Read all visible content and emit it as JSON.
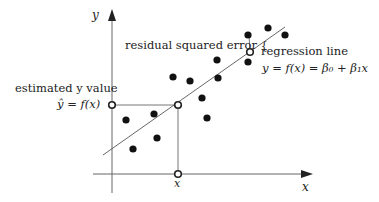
{
  "diagram": {
    "type": "linear regression illustration",
    "axes": {
      "x_label": "x",
      "y_label": "y",
      "x_axis": {
        "x1": 93,
        "x2": 312,
        "y": 174
      },
      "y_axis": {
        "x": 112,
        "y1": 193,
        "y2": 10
      }
    },
    "regression_line": {
      "x1": 103,
      "y1": 155,
      "x2": 285,
      "y2": 27,
      "color": "#555555"
    },
    "points": [
      {
        "x": 126,
        "y": 120
      },
      {
        "x": 133,
        "y": 149
      },
      {
        "x": 154,
        "y": 114
      },
      {
        "x": 157,
        "y": 138
      },
      {
        "x": 173,
        "y": 77
      },
      {
        "x": 190,
        "y": 81
      },
      {
        "x": 202,
        "y": 98
      },
      {
        "x": 207,
        "y": 118
      },
      {
        "x": 217,
        "y": 60
      },
      {
        "x": 218,
        "y": 78
      },
      {
        "x": 248,
        "y": 35
      },
      {
        "x": 248,
        "y": 62
      },
      {
        "x": 268,
        "y": 28
      },
      {
        "x": 285,
        "y": 35
      }
    ],
    "point_color": "#111111",
    "hollow_points": [
      {
        "name": "estimated-y-marker",
        "x": 112,
        "y": 105
      },
      {
        "name": "prediction-point",
        "x": 178,
        "y": 105
      },
      {
        "name": "x-value-marker",
        "x": 178,
        "y": 174
      },
      {
        "name": "line-point-at-residual",
        "x": 250,
        "y": 52
      }
    ],
    "guide_lines": [
      {
        "x1": 112,
        "y1": 105,
        "x2": 178,
        "y2": 105
      },
      {
        "x1": 178,
        "y1": 105,
        "x2": 178,
        "y2": 174
      },
      {
        "x1": 248,
        "y1": 35,
        "x2": 250,
        "y2": 52
      }
    ],
    "labels": {
      "y_axis": "y",
      "x_axis": "x",
      "x_value": "x",
      "residual": "residual squared error {",
      "regression_line": "regression line",
      "equation": "y = f(x) = β₀ + β₁x",
      "estimated_value": "estimated y value",
      "estimated_formula": "ŷ = f(x)"
    }
  }
}
